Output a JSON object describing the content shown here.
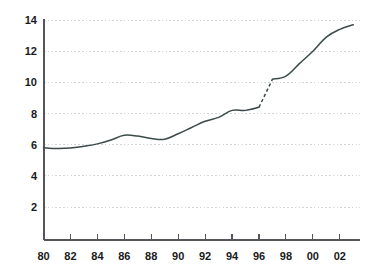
{
  "chart_data": {
    "type": "line",
    "title": "",
    "subtitle": "",
    "xlabel": "",
    "ylabel": "",
    "xlim": [
      1980,
      2003
    ],
    "ylim": [
      0,
      14
    ],
    "grid": true,
    "legend": false,
    "legend_position": "none",
    "line_color": "#3c4a4a",
    "grid_color": "#c8c8d2",
    "axis_color": "#55555c",
    "text_color": "#1a1a1a",
    "y_ticks": [
      2,
      4,
      6,
      8,
      10,
      12,
      14
    ],
    "y_tick_labels": [
      "2",
      "4",
      "6",
      "8",
      "10",
      "12",
      "14"
    ],
    "x_ticks": [
      1980,
      1982,
      1984,
      1986,
      1988,
      1990,
      1992,
      1994,
      1996,
      1998,
      2000,
      2002
    ],
    "x_tick_labels": [
      "80",
      "82",
      "84",
      "86",
      "88",
      "90",
      "92",
      "94",
      "96",
      "98",
      "00",
      "02"
    ],
    "x": [
      1980,
      1981,
      1982,
      1983,
      1984,
      1985,
      1986,
      1987,
      1988,
      1989,
      1990,
      1991,
      1992,
      1993,
      1994,
      1995,
      1996,
      1997,
      1998,
      1999,
      2000,
      2001,
      2002,
      2003
    ],
    "values": [
      5.8,
      5.75,
      5.78,
      5.9,
      6.05,
      6.3,
      6.6,
      6.55,
      6.4,
      6.35,
      6.7,
      7.1,
      7.5,
      7.75,
      8.2,
      8.2,
      8.4,
      10.2,
      10.4,
      11.2,
      12.0,
      12.9,
      13.4,
      13.7
    ],
    "series": [
      {
        "name": "series-1",
        "style": "solid",
        "x": [
          1980,
          1981,
          1982,
          1983,
          1984,
          1985,
          1986,
          1987,
          1988,
          1989,
          1990,
          1991,
          1992,
          1993,
          1994,
          1995,
          1996
        ],
        "values": [
          5.8,
          5.75,
          5.78,
          5.9,
          6.05,
          6.3,
          6.6,
          6.55,
          6.4,
          6.35,
          6.7,
          7.1,
          7.5,
          7.75,
          8.2,
          8.2,
          8.4
        ]
      },
      {
        "name": "series-break",
        "style": "dashed",
        "x": [
          1996,
          1997
        ],
        "values": [
          8.4,
          10.2
        ]
      },
      {
        "name": "series-2",
        "style": "solid",
        "x": [
          1997,
          1998,
          1999,
          2000,
          2001,
          2002,
          2003
        ],
        "values": [
          10.2,
          10.4,
          11.2,
          12.0,
          12.9,
          13.4,
          13.7
        ]
      }
    ],
    "annotations": []
  }
}
